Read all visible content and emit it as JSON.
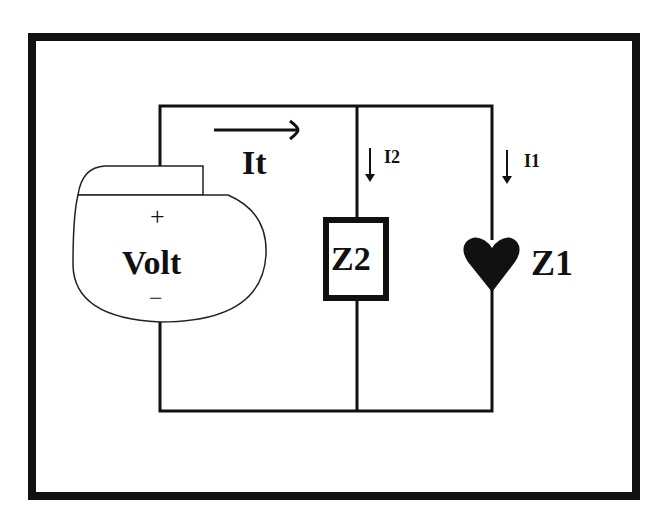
{
  "diagram": {
    "type": "parallel-circuit",
    "source": {
      "label": "Volt",
      "positive": "+",
      "negative": "−"
    },
    "total_current": {
      "label": "It",
      "direction": "right"
    },
    "branches": [
      {
        "impedance": "Z2",
        "symbol": "rectangle",
        "current": "I2",
        "direction": "down"
      },
      {
        "impedance": "Z1",
        "symbol": "heart",
        "current": "I1",
        "direction": "down"
      }
    ]
  },
  "colors": {
    "ink": "#111111",
    "background": "#ffffff"
  }
}
